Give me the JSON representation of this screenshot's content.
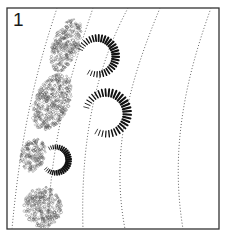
{
  "figure": {
    "panel_label": "1",
    "frame": {
      "x": 7,
      "y": 8,
      "width": 212,
      "height": 221,
      "stroke": "#333333"
    },
    "colors": {
      "frame": "#333333",
      "dotted_line": "#666666",
      "crescent": "#111111",
      "cluster": "#555555",
      "background": "#ffffff"
    },
    "dotted_lines": [
      {
        "id": "line-1",
        "path": "M57 8 C40 60 22 120 12 229"
      },
      {
        "id": "line-2",
        "path": "M93 8 C72 70 50 140 48 229"
      },
      {
        "id": "line-3",
        "path": "M128 8 C100 60 80 130 83 229"
      },
      {
        "id": "line-4",
        "path": "M160 8 C130 80 110 150 125 229"
      },
      {
        "id": "line-5",
        "path": "M211 8 C185 80 170 150 183 229"
      }
    ],
    "crescents": [
      {
        "id": "crescent-1",
        "cx": 98,
        "cy": 56,
        "r": 21,
        "start_deg": 200,
        "end_deg": 480
      },
      {
        "id": "crescent-2",
        "cx": 107,
        "cy": 113,
        "r": 24,
        "start_deg": 195,
        "end_deg": 480
      },
      {
        "id": "crescent-3",
        "cx": 56,
        "cy": 160,
        "r": 15,
        "start_deg": 240,
        "end_deg": 500
      }
    ],
    "clusters": [
      {
        "id": "cluster-1",
        "cx": 66,
        "cy": 45,
        "rx": 13,
        "ry": 28,
        "rot": 20
      },
      {
        "id": "cluster-2",
        "cx": 52,
        "cy": 102,
        "rx": 17,
        "ry": 30,
        "rot": 25
      },
      {
        "id": "cluster-3",
        "cx": 33,
        "cy": 155,
        "rx": 12,
        "ry": 17,
        "rot": 20
      },
      {
        "id": "cluster-4",
        "cx": 43,
        "cy": 207,
        "rx": 19,
        "ry": 20,
        "rot": 0
      }
    ]
  }
}
